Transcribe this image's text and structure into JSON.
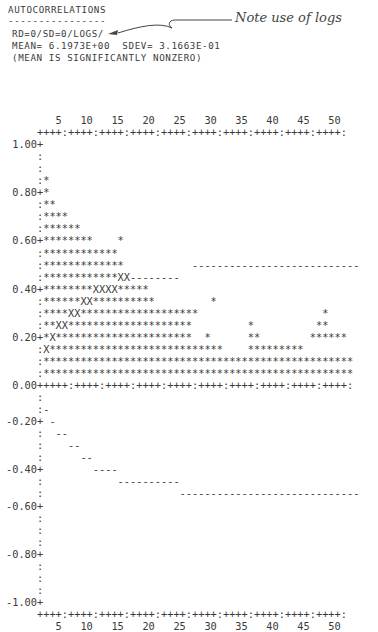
{
  "header": {
    "title": "AUTOCORRELATIONS",
    "underline": "----------------",
    "series_spec": "RD=0/SD=0/LOGS/",
    "stats": "MEAN= 6.1973E+00  SDEV= 3.1663E-01",
    "note": "(MEAN IS SIGNIFICANTLY NONZERO)"
  },
  "annotation": {
    "text": "Note use of logs"
  },
  "plot_lines": [
    "        5   10   15   20   25   30   35   40   45   50",
    "     ++++:++++:++++:++++:++++:++++:++++:++++:++++:++++:",
    " 1.00+",
    "     :",
    "     :",
    "     :*",
    " 0.80+*",
    "     :**",
    "     :****",
    "     :******",
    " 0.60+********    *",
    "     :************",
    "     :*************           ---------------------------",
    "     :************XX--------",
    " 0.40+********XXXX*****",
    "     :******XX**********         *",
    "     :****XX*******************                    *",
    "     :**XX********************         *          **",
    " 0.20+*X**********************  *      **        ******",
    "     :X****************************    *********",
    "     :**************************************************",
    "     :**************************************************",
    " 0.00+++++:++++:++++:++++:++++:++++:++++:++++:++++:++++:",
    "     :",
    "     :-",
    "-0.20+ -",
    "     :  --",
    "     :    --",
    "     :      --",
    "-0.40+        ----",
    "     :            ----------",
    "     :                      -----------------------------",
    "-0.60+",
    "     :",
    "     :",
    "     :",
    "-0.80+",
    "     :",
    "     :",
    "     :",
    "-1.00+",
    "     ++++:++++:++++:++++:++++:++++:++++:++++:++++:++++:",
    "        5   10   15   20   25   30   35   40   45   50"
  ],
  "chart_data": {
    "type": "bar",
    "title": "AUTOCORRELATIONS",
    "subtitle": "RD=0/SD=0/LOGS/  MEAN= 6.1973E+00  SDEV= 3.1663E-01 (MEAN IS SIGNIFICANTLY NONZERO)",
    "xlabel": "Lag",
    "ylabel": "Autocorrelation",
    "x_ticks": [
      5,
      10,
      15,
      20,
      25,
      30,
      35,
      40,
      45,
      50
    ],
    "y_ticks": [
      1.0,
      0.8,
      0.6,
      0.4,
      0.2,
      0.0,
      -0.2,
      -0.4,
      -0.6,
      -0.8,
      -1.0
    ],
    "ylim": [
      -1.0,
      1.0
    ],
    "xlim": [
      1,
      50
    ],
    "rendering": "line-printer histogram, bars drawn with '*', 'X' marks where bar meets confidence band, '-' marks confidence limits",
    "annotations": [
      "Note use of logs"
    ],
    "series": [
      {
        "name": "Autocorrelation (approx, read from printout)",
        "x": [
          1,
          2,
          3,
          4,
          5,
          6,
          7,
          8,
          9,
          10,
          11,
          12,
          13,
          14,
          15,
          16,
          17,
          18,
          19,
          20,
          21,
          22,
          23,
          24,
          25,
          26,
          27,
          28,
          29,
          30,
          31,
          32,
          33,
          34,
          35,
          36,
          37,
          38,
          39,
          40,
          41,
          42,
          43,
          44,
          45,
          46,
          47,
          48,
          49,
          50
        ],
        "values": [
          0.85,
          0.75,
          0.7,
          0.7,
          0.65,
          0.65,
          0.6,
          0.6,
          0.55,
          0.55,
          0.55,
          0.55,
          0.5,
          0.45,
          0.45,
          0.4,
          0.4,
          0.4,
          0.35,
          0.35,
          0.35,
          0.3,
          0.3,
          0.35,
          0.25,
          0.25,
          0.2,
          0.2,
          0.15,
          0.1,
          0.1,
          0.1,
          0.2,
          0.2,
          0.1,
          0.1,
          0.1,
          0.1,
          0.1,
          0.1,
          0.1,
          0.15,
          0.15,
          0.15,
          0.25,
          0.2,
          0.2,
          0.2,
          0.15,
          0.15
        ]
      },
      {
        "name": "Upper confidence limit",
        "values_desc": "approx +0.05 at lag 1 rising stepwise to about +0.45 (lags 15-22) and +0.48 (lags 24-50)"
      },
      {
        "name": "Lower confidence limit",
        "values_desc": "approx -0.15 at lag 1 falling stepwise to about -0.40 (lags 9-12), -0.45 (lags 13-22), -0.50 (lags 23-50)"
      }
    ]
  }
}
